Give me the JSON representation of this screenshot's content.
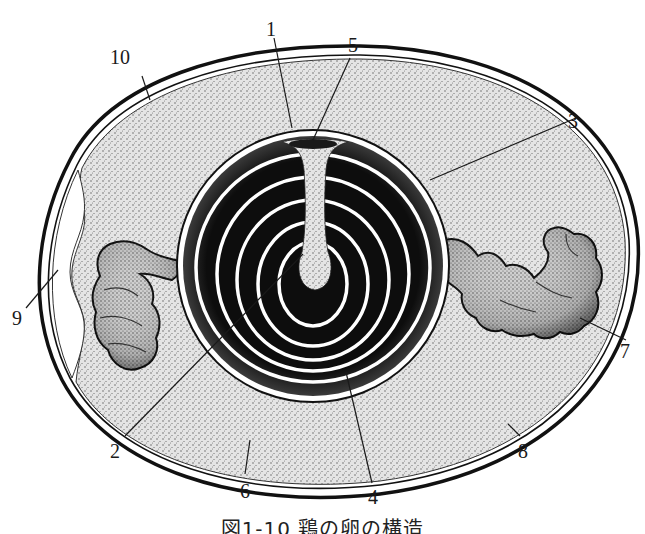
{
  "figure": {
    "caption": "図1-10 鶏の卵の構造",
    "type": "cross-section illustration of a chicken egg",
    "colors": {
      "shell": "#111111",
      "albumen_stipple": "#d9d9d9",
      "yolk": "#0d0d0d",
      "background": "#ffffff"
    }
  },
  "labels": [
    {
      "id": "1",
      "text": "1",
      "points_to": "vitelline membrane (top of yolk)"
    },
    {
      "id": "2",
      "text": "2",
      "points_to": "latebra center"
    },
    {
      "id": "3",
      "text": "3",
      "points_to": "yolk outer layer"
    },
    {
      "id": "4",
      "text": "4",
      "points_to": "yolk layers (white rings)"
    },
    {
      "id": "5",
      "text": "5",
      "points_to": "germinal disc"
    },
    {
      "id": "6",
      "text": "6",
      "points_to": "thick albumen"
    },
    {
      "id": "7",
      "text": "7",
      "points_to": "chalaza"
    },
    {
      "id": "8",
      "text": "8",
      "points_to": "shell membrane"
    },
    {
      "id": "9",
      "text": "9",
      "points_to": "air cell"
    },
    {
      "id": "10",
      "text": "10",
      "points_to": "shell"
    }
  ]
}
